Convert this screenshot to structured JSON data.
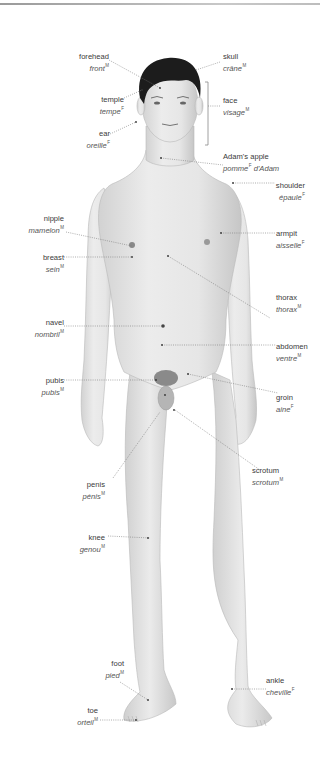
{
  "colors": {
    "skin": "#e4e4e4",
    "skin_shadow": "#c9c9c9",
    "hair": "#1c1c1c",
    "leader": "#6a6a6a",
    "text": "#3a3a3a"
  },
  "labels": [
    {
      "id": "forehead",
      "en": "forehead",
      "fr": "front",
      "gender": "M"
    },
    {
      "id": "temple",
      "en": "temple",
      "fr": "tempe",
      "gender": "F"
    },
    {
      "id": "ear",
      "en": "ear",
      "fr": "oreille",
      "gender": "F"
    },
    {
      "id": "skull",
      "en": "skull",
      "fr": "crâne",
      "gender": "M"
    },
    {
      "id": "face",
      "en": "face",
      "fr": "visage",
      "gender": "M"
    },
    {
      "id": "adams-apple",
      "en": "Adam's apple",
      "fr": "pomme",
      "gender": "F",
      "fr_suffix": " d'Adam"
    },
    {
      "id": "shoulder",
      "en": "shoulder",
      "fr": "épaule",
      "gender": "F"
    },
    {
      "id": "nipple",
      "en": "nipple",
      "fr": "mamelon",
      "gender": "M"
    },
    {
      "id": "armpit",
      "en": "armpit",
      "fr": "aisselle",
      "gender": "F"
    },
    {
      "id": "breast",
      "en": "breast",
      "fr": "sein",
      "gender": "M"
    },
    {
      "id": "thorax",
      "en": "thorax",
      "fr": "thorax",
      "gender": "M"
    },
    {
      "id": "navel",
      "en": "navel",
      "fr": "nombril",
      "gender": "M"
    },
    {
      "id": "abdomen",
      "en": "abdomen",
      "fr": "ventre",
      "gender": "M"
    },
    {
      "id": "pubis",
      "en": "pubis",
      "fr": "pubis",
      "gender": "M"
    },
    {
      "id": "groin",
      "en": "groin",
      "fr": "aine",
      "gender": "F"
    },
    {
      "id": "penis",
      "en": "penis",
      "fr": "pénis",
      "gender": "M"
    },
    {
      "id": "scrotum",
      "en": "scrotum",
      "fr": "scrotum",
      "gender": "M"
    },
    {
      "id": "knee",
      "en": "knee",
      "fr": "genou",
      "gender": "M"
    },
    {
      "id": "foot",
      "en": "foot",
      "fr": "pied",
      "gender": "M"
    },
    {
      "id": "ankle",
      "en": "ankle",
      "fr": "cheville",
      "gender": "F"
    },
    {
      "id": "toe",
      "en": "toe",
      "fr": "orteil",
      "gender": "M"
    }
  ]
}
